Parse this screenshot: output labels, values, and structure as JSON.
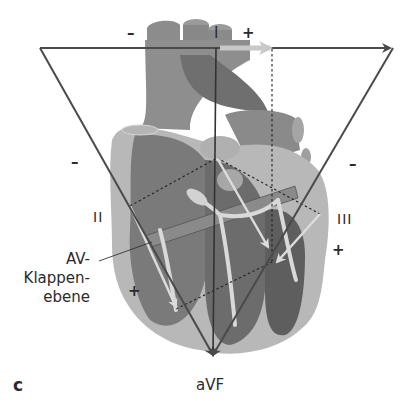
{
  "figure": {
    "panel_label": "c",
    "lead_labels": {
      "I": "I",
      "II": "II",
      "III": "III",
      "aVF": "aVF"
    },
    "polarity": {
      "lead_I_negative": "–",
      "lead_I_positive": "+",
      "lead_II_negative": "–",
      "lead_II_positive": "+",
      "lead_III_negative": "–",
      "lead_III_positive": "+"
    },
    "annotation": {
      "line1": "AV-",
      "line2": "Klappen-",
      "line3": "ebene"
    },
    "colors": {
      "triangle": "#4a4a4a",
      "heart_dark": "#6e6e6e",
      "heart_mid": "#8c8c8c",
      "heart_light": "#b5b5b5",
      "conduction": "#d9d9d9",
      "vector_arrow": "#c8c8c8"
    }
  }
}
